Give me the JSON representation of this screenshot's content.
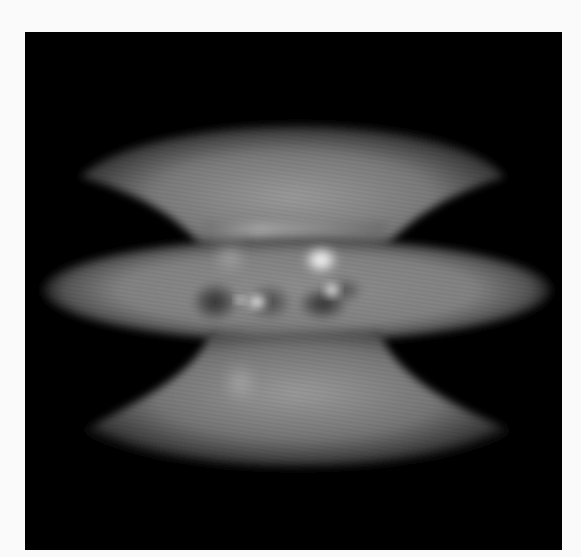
{
  "figure": {
    "background_color": "#000000",
    "page_color": "#fafafa",
    "surface_color": "#8a8a8a",
    "highlight_color": "#ffffff",
    "frame": {
      "x": 25,
      "y": 32,
      "width": 537,
      "height": 518
    }
  }
}
